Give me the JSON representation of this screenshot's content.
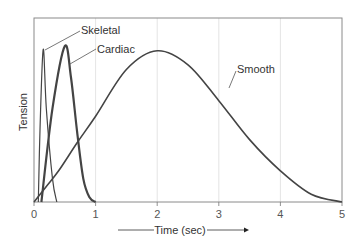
{
  "chart_data": {
    "type": "line",
    "title": "",
    "xlabel": "Time (sec)",
    "ylabel": "Tension",
    "xlim": [
      0,
      5
    ],
    "ylim": [
      0,
      118
    ],
    "x_ticks": [
      "0",
      "1",
      "2",
      "3",
      "4",
      "5"
    ],
    "y_ticks": [],
    "grid": {
      "x": true,
      "y": false
    },
    "legend": "inline labels with leader lines",
    "series": [
      {
        "name": "Skeletal",
        "x": [
          0.07,
          0.1,
          0.15,
          0.2,
          0.3,
          0.37
        ],
        "y": [
          0,
          50,
          98,
          60,
          15,
          0
        ]
      },
      {
        "name": "Cardiac",
        "x": [
          0.12,
          0.3,
          0.5,
          0.6,
          0.7,
          0.8,
          0.9,
          1.0
        ],
        "y": [
          0,
          60,
          100,
          80,
          45,
          15,
          3,
          0
        ]
      },
      {
        "name": "Smooth",
        "x": [
          0,
          0.2,
          0.4,
          0.7,
          1.0,
          1.5,
          2.0,
          2.5,
          3.0,
          3.5,
          4.0,
          4.5,
          5.0
        ],
        "y": [
          0,
          10,
          20,
          38,
          55,
          85,
          97,
          88,
          65,
          40,
          20,
          5,
          0
        ]
      }
    ]
  },
  "colors": {
    "curve": "#444444",
    "frame": "#888888",
    "grid": "#dddddd",
    "text": "#333333"
  }
}
